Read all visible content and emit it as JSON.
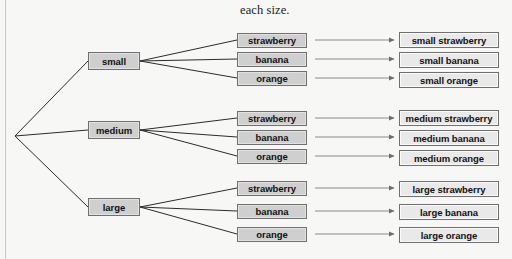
{
  "caption": {
    "text": "each size.",
    "x": 240,
    "y": 3
  },
  "diagram": {
    "type": "tree",
    "colors": {
      "background": "#f7f7f5",
      "node_fill": "#cfcfcf",
      "leaf_fill": "#e9e9e9",
      "node_border": "#6f6f6f",
      "branch_line": "#2b2b2b",
      "arrow_line": "#8a8a8a",
      "text": "#111111"
    },
    "root": {
      "name": "root",
      "x": 14,
      "y": 136
    },
    "levels": [
      {
        "name": "size",
        "label": "size"
      },
      {
        "name": "fruit",
        "label": "fruit"
      },
      {
        "name": "result",
        "label": "combined label"
      }
    ],
    "sizes": [
      {
        "label": "small",
        "x": 88,
        "y": 52,
        "w": 52,
        "h": 18
      },
      {
        "label": "medium",
        "x": 88,
        "y": 121,
        "w": 52,
        "h": 18
      },
      {
        "label": "large",
        "x": 88,
        "y": 198,
        "w": 52,
        "h": 18
      }
    ],
    "fruits": [
      {
        "label": "strawberry",
        "x": 237,
        "y": 33,
        "w": 70,
        "h": 15
      },
      {
        "label": "banana",
        "x": 237,
        "y": 52,
        "w": 70,
        "h": 15
      },
      {
        "label": "orange",
        "x": 237,
        "y": 71,
        "w": 70,
        "h": 15
      },
      {
        "label": "strawberry",
        "x": 237,
        "y": 111,
        "w": 70,
        "h": 15
      },
      {
        "label": "banana",
        "x": 237,
        "y": 130,
        "w": 70,
        "h": 15
      },
      {
        "label": "orange",
        "x": 237,
        "y": 149,
        "w": 70,
        "h": 15
      },
      {
        "label": "strawberry",
        "x": 237,
        "y": 181,
        "w": 70,
        "h": 15
      },
      {
        "label": "banana",
        "x": 237,
        "y": 204,
        "w": 70,
        "h": 15
      },
      {
        "label": "orange",
        "x": 237,
        "y": 227,
        "w": 70,
        "h": 15
      }
    ],
    "results": [
      {
        "label": "small strawberry",
        "x": 399,
        "y": 32,
        "w": 100,
        "h": 16
      },
      {
        "label": "small banana",
        "x": 399,
        "y": 52,
        "w": 100,
        "h": 16
      },
      {
        "label": "small orange",
        "x": 399,
        "y": 72,
        "w": 100,
        "h": 16
      },
      {
        "label": "medium strawberry",
        "x": 399,
        "y": 110,
        "w": 100,
        "h": 16
      },
      {
        "label": "medium banana",
        "x": 399,
        "y": 130,
        "w": 100,
        "h": 16
      },
      {
        "label": "medium orange",
        "x": 399,
        "y": 150,
        "w": 100,
        "h": 16
      },
      {
        "label": "large strawberry",
        "x": 399,
        "y": 181,
        "w": 100,
        "h": 16
      },
      {
        "label": "large banana",
        "x": 399,
        "y": 204,
        "w": 100,
        "h": 16
      },
      {
        "label": "large orange",
        "x": 399,
        "y": 227,
        "w": 100,
        "h": 16
      }
    ],
    "root_edges": [
      {
        "from": "root",
        "to": "small",
        "x1": 15,
        "y1": 136,
        "x2": 88,
        "y2": 61
      },
      {
        "from": "root",
        "to": "medium",
        "x1": 15,
        "y1": 136,
        "x2": 88,
        "y2": 130
      },
      {
        "from": "root",
        "to": "large",
        "x1": 15,
        "y1": 136,
        "x2": 88,
        "y2": 207
      }
    ],
    "size_edges": [
      {
        "from": "small",
        "to": "strawberry",
        "x1": 140,
        "y1": 61,
        "x2": 237,
        "y2": 40
      },
      {
        "from": "small",
        "to": "banana",
        "x1": 140,
        "y1": 61,
        "x2": 237,
        "y2": 59
      },
      {
        "from": "small",
        "to": "orange",
        "x1": 140,
        "y1": 61,
        "x2": 237,
        "y2": 78
      },
      {
        "from": "medium",
        "to": "strawberry",
        "x1": 140,
        "y1": 130,
        "x2": 237,
        "y2": 118
      },
      {
        "from": "medium",
        "to": "banana",
        "x1": 140,
        "y1": 130,
        "x2": 237,
        "y2": 137
      },
      {
        "from": "medium",
        "to": "orange",
        "x1": 140,
        "y1": 130,
        "x2": 237,
        "y2": 156
      },
      {
        "from": "large",
        "to": "strawberry",
        "x1": 140,
        "y1": 207,
        "x2": 237,
        "y2": 188
      },
      {
        "from": "large",
        "to": "banana",
        "x1": 140,
        "y1": 207,
        "x2": 237,
        "y2": 211
      },
      {
        "from": "large",
        "to": "orange",
        "x1": 140,
        "y1": 207,
        "x2": 237,
        "y2": 234
      }
    ],
    "result_arrows": [
      {
        "x1": 315,
        "y1": 40,
        "x2": 394,
        "y2": 40
      },
      {
        "x1": 315,
        "y1": 59,
        "x2": 394,
        "y2": 59
      },
      {
        "x1": 315,
        "y1": 78,
        "x2": 394,
        "y2": 78
      },
      {
        "x1": 315,
        "y1": 118,
        "x2": 394,
        "y2": 118
      },
      {
        "x1": 315,
        "y1": 137,
        "x2": 394,
        "y2": 137
      },
      {
        "x1": 315,
        "y1": 156,
        "x2": 394,
        "y2": 156
      },
      {
        "x1": 315,
        "y1": 188,
        "x2": 394,
        "y2": 188
      },
      {
        "x1": 315,
        "y1": 211,
        "x2": 394,
        "y2": 211
      },
      {
        "x1": 315,
        "y1": 234,
        "x2": 394,
        "y2": 234
      }
    ]
  }
}
